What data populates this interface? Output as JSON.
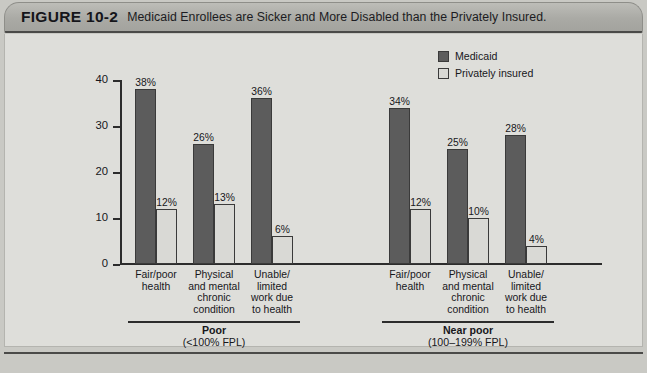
{
  "header": {
    "figure_number": "FIGURE 10-2",
    "title": "Medicaid Enrollees are Sicker and More Disabled than the Privately Insured."
  },
  "colors": {
    "medicaid": "#5c5c5c",
    "private": "#d9d9d5",
    "axis": "#2c2c2c",
    "panel_bg": "#dededa",
    "header_bg": "#aaaaa5"
  },
  "footer": {
    "note": ""
  },
  "chart_data": {
    "type": "bar",
    "title": "Medicaid Enrollees are Sicker and More Disabled than the Privately Insured.",
    "xlabel": "",
    "ylabel": "",
    "ylim": [
      0,
      40
    ],
    "yticks": [
      0,
      10,
      20,
      30,
      40
    ],
    "ytick_labels": [
      "0",
      "10",
      "20",
      "30",
      "40"
    ],
    "grid": false,
    "legend_position": "top-right",
    "legend": [
      "Medicaid",
      "Privately insured"
    ],
    "categories": [
      "Fair/poor health",
      "Physical and mental chronic condition",
      "Unable/ limited work due to health"
    ],
    "category_label_lines": [
      [
        "Fair/poor",
        "health"
      ],
      [
        "Physical",
        "and mental",
        "chronic",
        "condition"
      ],
      [
        "Unable/",
        "limited",
        "work due",
        "to health"
      ]
    ],
    "groups": [
      {
        "name": "Poor",
        "subtitle": "(<100% FPL)",
        "series": [
          {
            "name": "Medicaid",
            "values": [
              38,
              26,
              36
            ],
            "labels": [
              "38%",
              "26%",
              "36%"
            ]
          },
          {
            "name": "Privately insured",
            "values": [
              12,
              13,
              6
            ],
            "labels": [
              "12%",
              "13%",
              "6%"
            ]
          }
        ]
      },
      {
        "name": "Near poor",
        "subtitle": "(100–199% FPL)",
        "series": [
          {
            "name": "Medicaid",
            "values": [
              34,
              25,
              28
            ],
            "labels": [
              "34%",
              "25%",
              "28%"
            ]
          },
          {
            "name": "Privately insured",
            "values": [
              12,
              10,
              4
            ],
            "labels": [
              "12%",
              "10%",
              "4%"
            ]
          }
        ]
      }
    ]
  }
}
